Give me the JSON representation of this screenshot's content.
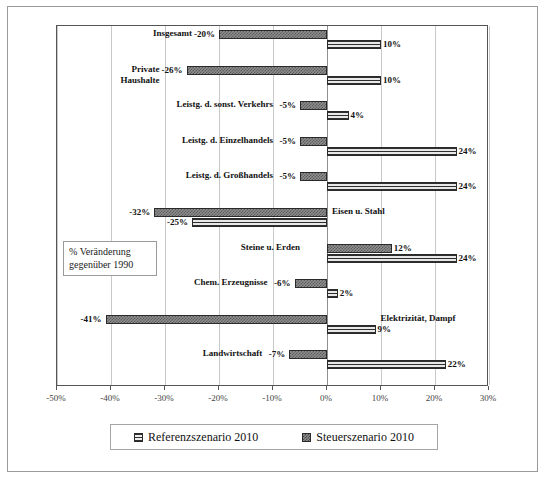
{
  "chart_data": {
    "type": "bar",
    "orientation": "horizontal",
    "title": "",
    "xlabel": "",
    "ylabel": "",
    "xlim": [
      -50,
      30
    ],
    "xticks": [
      -50,
      -40,
      -30,
      -20,
      -10,
      0,
      10,
      20,
      30
    ],
    "xtick_labels": [
      "-50%",
      "-40%",
      "-30%",
      "-20%",
      "-10%",
      "0%",
      "10%",
      "20%",
      "30%"
    ],
    "grid": true,
    "grid_axis": "x",
    "legend_position": "bottom",
    "annotation": "% Veränderung\ngegenüber 1990",
    "categories": [
      "Insgesamt",
      "Private\nHaushalte",
      "Leistg. d. sonst. Verkehrs",
      "Leistg. d. Einzelhandels",
      "Leistg. d. Großhandels",
      "Eisen u. Stahl",
      "Steine u. Erden",
      "Chem. Erzeugnisse",
      "Elektrizität, Dampf",
      "Landwirtschaft"
    ],
    "series": [
      {
        "name": "Steuerszenario 2010",
        "pattern": "checker",
        "values": [
          -20,
          -26,
          -5,
          -5,
          -5,
          -32,
          12,
          -6,
          -41,
          -7
        ],
        "value_labels": [
          "-20%",
          "-26%",
          "-5%",
          "-5%",
          "-5%",
          "-32%",
          "12%",
          "-6%",
          "-41%",
          "-7%"
        ]
      },
      {
        "name": "Referenzszenario 2010",
        "pattern": "horizontal-stripes",
        "values": [
          10,
          10,
          4,
          24,
          24,
          -25,
          24,
          2,
          9,
          22
        ],
        "value_labels": [
          "10%",
          "10%",
          "4%",
          "24%",
          "24%",
          "-25%",
          "24%",
          "2%",
          "9%",
          "22%"
        ]
      }
    ]
  },
  "legend": {
    "entries": [
      {
        "label": "Referenzszenario 2010",
        "pattern": "horizontal-stripes"
      },
      {
        "label": "Steuerszenario 2010",
        "pattern": "checker"
      }
    ]
  },
  "colors": {
    "steuer_fill": "#8e8e8e",
    "steuer_pattern": "#5c5c5c",
    "referenz_fill": "#dcdcdc",
    "referenz_pattern": "#2f2f2f",
    "bar_outline": "#2a2a2a",
    "gridline": "#c9c9c9",
    "axis": "#555555",
    "frame": "#9a9a9a",
    "text": "#111111"
  }
}
